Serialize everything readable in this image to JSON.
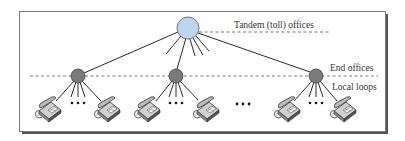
{
  "diagram": {
    "type": "telephone network hierarchy",
    "labels": {
      "tandem": "Tandem (toll) offices",
      "end_offices": "End offices",
      "local_loops": "Local loops",
      "ellipsis": "•••"
    },
    "colors": {
      "tandem_fill": "#bcd6ee",
      "end_office_fill": "#7a7a7a",
      "line": "#2a2a2a",
      "dashed": "#555555",
      "frame": "#666666"
    },
    "nodes": {
      "tandem": {
        "x": 188,
        "y": 28,
        "r": 11
      },
      "end_offices": [
        {
          "x": 78,
          "y": 76,
          "r": 7
        },
        {
          "x": 176,
          "y": 76,
          "r": 7
        },
        {
          "x": 316,
          "y": 76,
          "r": 7
        }
      ]
    },
    "phones": [
      {
        "x": 48,
        "y": 108
      },
      {
        "x": 107,
        "y": 108
      },
      {
        "x": 147,
        "y": 108
      },
      {
        "x": 206,
        "y": 108
      },
      {
        "x": 287,
        "y": 108
      },
      {
        "x": 343,
        "y": 108
      }
    ]
  }
}
